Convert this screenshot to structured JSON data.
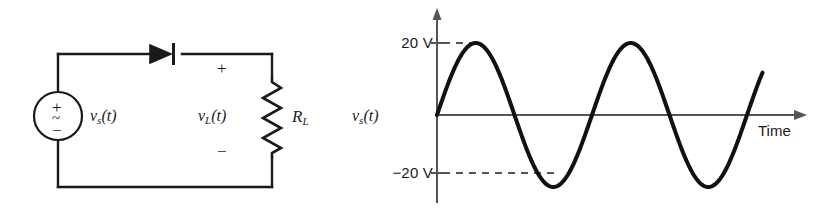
{
  "figure": {
    "background_color": "#ffffff",
    "ink_color": "#1a1a1a"
  },
  "circuit": {
    "source": {
      "name": "ac-voltage-source",
      "plus_sign": "+",
      "ac_sign": "~",
      "minus_sign": "−",
      "label": {
        "base": "v",
        "subscript": "s",
        "arg": "(t)",
        "full": "v_s(t)"
      }
    },
    "diode": {
      "name": "diode",
      "orientation": "anode-left-cathode-right"
    },
    "load": {
      "resistor_label": {
        "base": "R",
        "subscript": "L",
        "full": "R_L"
      },
      "voltage_label": {
        "base": "v",
        "subscript": "L",
        "arg": "(t)",
        "full": "v_L(t)"
      },
      "polarity_plus": "+",
      "polarity_minus": "−"
    }
  },
  "chart_data": {
    "type": "line",
    "title": "",
    "xlabel": "Time",
    "ylabel": "v_s(t)",
    "ylabel_parts": {
      "base": "v",
      "subscript": "s",
      "arg": "(t)"
    },
    "ytick_labels": [
      "20 V",
      "−20 V"
    ],
    "ytick_values": [
      20,
      -20
    ],
    "ylim": [
      -26,
      26
    ],
    "xlim": [
      0,
      2.1
    ],
    "grid": false,
    "legend": null,
    "annotations": [
      {
        "text": "20 V",
        "type": "y-axis-tick",
        "value": 20,
        "dashed_leader": true
      },
      {
        "text": "−20 V",
        "type": "y-axis-tick",
        "value": -20,
        "dashed_leader": true
      },
      {
        "text": "Time",
        "type": "x-axis-label"
      }
    ],
    "series": [
      {
        "name": "v_s(t)",
        "waveform": "sine",
        "amplitude": 20,
        "cycles": 2.1,
        "phase_deg": 0,
        "color": "#111111",
        "linewidth": 4
      }
    ],
    "x": [
      0.0,
      0.05,
      0.1,
      0.15,
      0.2,
      0.25,
      0.3,
      0.35,
      0.4,
      0.45,
      0.5,
      0.55,
      0.6,
      0.65,
      0.7,
      0.75,
      0.8,
      0.85,
      0.9,
      0.95,
      1.0,
      1.05,
      1.1,
      1.15,
      1.2,
      1.25,
      1.3,
      1.35,
      1.4,
      1.45,
      1.5,
      1.55,
      1.6,
      1.65,
      1.7,
      1.75,
      1.8,
      1.85,
      1.9,
      1.95,
      2.0,
      2.05,
      2.1
    ],
    "y": [
      0.0,
      6.2,
      11.8,
      16.2,
      19.0,
      20.0,
      19.0,
      16.2,
      11.8,
      6.2,
      0.0,
      -6.2,
      -11.8,
      -16.2,
      -19.0,
      -20.0,
      -19.0,
      -16.2,
      -11.8,
      -6.2,
      0.0,
      6.2,
      11.8,
      16.2,
      19.0,
      20.0,
      19.0,
      16.2,
      11.8,
      6.2,
      0.0,
      -6.2,
      -11.8,
      -16.2,
      -19.0,
      -20.0,
      -19.0,
      -16.2,
      -11.8,
      -6.2,
      0.0,
      6.2,
      11.8
    ]
  }
}
